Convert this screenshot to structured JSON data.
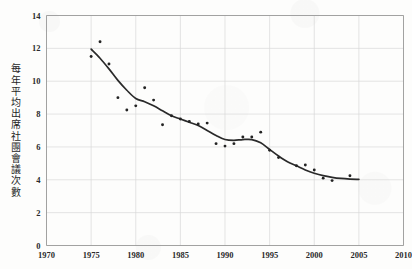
{
  "chart_data": {
    "type": "scatter",
    "title": "",
    "subtitle": "",
    "xlabel": "",
    "ylabel": "每年平均出席社團會議次數",
    "xlim": [
      1970,
      2010
    ],
    "ylim": [
      0,
      14
    ],
    "xticks": [
      1970,
      1975,
      1980,
      1985,
      1990,
      1995,
      2000,
      2005,
      2010
    ],
    "xtick_labels": [
      "1970",
      "1975",
      "1980",
      "1985",
      "1990",
      "1995",
      "2000",
      "2005",
      "2010"
    ],
    "yticks": [
      0,
      2,
      4,
      6,
      8,
      10,
      12,
      14
    ],
    "ytick_labels": [
      "0",
      "2",
      "4",
      "6",
      "8",
      "10",
      "12",
      "14"
    ],
    "grid": true,
    "legend": "none",
    "marker_color": "#232323",
    "line_color": "#2a2a2a",
    "grid_color": "#d9d9d9",
    "series": [
      {
        "name": "每年平均出席社團會議次數",
        "kind": "scatter",
        "x": [
          1975,
          1976,
          1977,
          1978,
          1979,
          1980,
          1981,
          1982,
          1983,
          1984,
          1985,
          1986,
          1987,
          1988,
          1989,
          1990,
          1991,
          1992,
          1993,
          1994,
          1995,
          1996,
          1998,
          1999,
          2000,
          2001,
          2002,
          2004
        ],
        "values": [
          11.5,
          12.4,
          11.05,
          9.0,
          8.25,
          8.5,
          9.6,
          8.85,
          7.35,
          7.9,
          7.7,
          7.55,
          7.4,
          7.45,
          6.2,
          6.05,
          6.2,
          6.6,
          6.6,
          6.9,
          5.8,
          5.35,
          4.85,
          4.9,
          4.6,
          4.1,
          3.95,
          4.25
        ]
      },
      {
        "name": "平滑趨勢線",
        "kind": "line",
        "x": [
          1975,
          1976,
          1977,
          1978,
          1979,
          1980,
          1981,
          1982,
          1983,
          1984,
          1985,
          1986,
          1987,
          1988,
          1989,
          1990,
          1991,
          1992,
          1993,
          1994,
          1995,
          1996,
          1997,
          1998,
          1999,
          2000,
          2001,
          2002,
          2003,
          2004,
          2005
        ],
        "values": [
          11.95,
          11.4,
          10.75,
          10.05,
          9.45,
          8.95,
          8.75,
          8.5,
          8.2,
          7.9,
          7.7,
          7.5,
          7.3,
          7.0,
          6.7,
          6.45,
          6.4,
          6.45,
          6.45,
          6.25,
          5.85,
          5.45,
          5.1,
          4.85,
          4.6,
          4.4,
          4.25,
          4.15,
          4.08,
          4.04,
          4.02
        ]
      }
    ]
  },
  "figure": {
    "background_color": "#fdfdfc"
  }
}
